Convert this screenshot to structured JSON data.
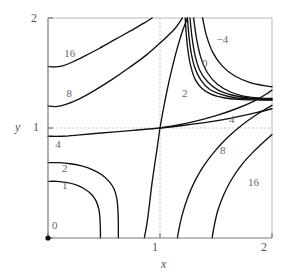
{
  "chart_data": {
    "type": "line",
    "title": "",
    "xlabel": "x",
    "ylabel": "y",
    "xlim": [
      0,
      2
    ],
    "ylim": [
      0,
      2
    ],
    "grid": true,
    "grid_lines": {
      "x": [
        1
      ],
      "y": [
        1
      ],
      "style": "dashed"
    },
    "xticks": [
      0,
      1,
      2
    ],
    "xtick_labels": [
      "0",
      "1",
      "2"
    ],
    "yticks": [
      0,
      1,
      2
    ],
    "ytick_labels": [
      "0",
      "1",
      "2"
    ],
    "origin_marker": true,
    "saddle_point": [
      1,
      1
    ],
    "contour_levels": [
      -4,
      0,
      1,
      2,
      4,
      8,
      16
    ],
    "contour_labels": [
      {
        "text": "16",
        "x": 0.19,
        "y": 1.67
      },
      {
        "text": "8",
        "x": 0.21,
        "y": 1.31
      },
      {
        "text": "4",
        "x": 0.11,
        "y": 0.85
      },
      {
        "text": "2",
        "x": 0.17,
        "y": 0.63
      },
      {
        "text": "1",
        "x": 0.17,
        "y": 0.47
      },
      {
        "text": "0",
        "x": 0.08,
        "y": 0.11
      },
      {
        "text": "−4",
        "x": 1.55,
        "y": 1.8
      },
      {
        "text": "0",
        "x": 1.42,
        "y": 1.58
      },
      {
        "text": "2",
        "x": 1.24,
        "y": 1.31
      },
      {
        "text": "4",
        "x": 1.66,
        "y": 1.07
      },
      {
        "text": "8",
        "x": 1.58,
        "y": 0.79
      },
      {
        "text": "16",
        "x": 1.83,
        "y": 0.5
      }
    ],
    "series": [
      {
        "name": "level-16-lower-left",
        "level": 16,
        "points": [
          [
            0.0,
            1.56
          ],
          [
            0.06,
            1.555
          ],
          [
            0.13,
            1.565
          ],
          [
            0.22,
            1.6
          ],
          [
            0.33,
            1.655
          ],
          [
            0.46,
            1.725
          ],
          [
            0.6,
            1.805
          ],
          [
            0.74,
            1.885
          ],
          [
            0.86,
            1.955
          ],
          [
            0.93,
            2.0
          ]
        ]
      },
      {
        "name": "level-8-lower-left",
        "level": 8,
        "points": [
          [
            0.0,
            1.2
          ],
          [
            0.07,
            1.195
          ],
          [
            0.16,
            1.215
          ],
          [
            0.28,
            1.265
          ],
          [
            0.42,
            1.345
          ],
          [
            0.57,
            1.44
          ],
          [
            0.72,
            1.545
          ],
          [
            0.88,
            1.665
          ],
          [
            1.02,
            1.79
          ],
          [
            1.13,
            1.9
          ],
          [
            1.2,
            2.0
          ]
        ]
      },
      {
        "name": "level-4-crossing",
        "level": 4,
        "points": [
          [
            0.0,
            0.925
          ],
          [
            0.12,
            0.925
          ],
          [
            0.26,
            0.935
          ],
          [
            0.42,
            0.95
          ],
          [
            0.6,
            0.965
          ],
          [
            0.8,
            0.982
          ],
          [
            1.0,
            1.0
          ],
          [
            1.22,
            1.025
          ],
          [
            1.44,
            1.055
          ],
          [
            1.66,
            1.095
          ],
          [
            1.86,
            1.14
          ],
          [
            2.0,
            1.175
          ]
        ]
      },
      {
        "name": "level-4-vertical-branch",
        "level": 4,
        "points": [
          [
            0.86,
            0.0
          ],
          [
            0.885,
            0.14
          ],
          [
            0.905,
            0.3
          ],
          [
            0.925,
            0.47
          ],
          [
            0.95,
            0.65
          ],
          [
            0.975,
            0.82
          ],
          [
            1.0,
            1.0
          ],
          [
            1.03,
            1.17
          ],
          [
            1.065,
            1.35
          ],
          [
            1.105,
            1.53
          ],
          [
            1.15,
            1.71
          ],
          [
            1.2,
            1.88
          ],
          [
            1.245,
            2.0
          ]
        ]
      },
      {
        "name": "level-2-lower-left",
        "level": 2,
        "points": [
          [
            0.0,
            0.685
          ],
          [
            0.1,
            0.685
          ],
          [
            0.2,
            0.675
          ],
          [
            0.3,
            0.655
          ],
          [
            0.4,
            0.62
          ],
          [
            0.48,
            0.575
          ],
          [
            0.545,
            0.515
          ],
          [
            0.59,
            0.445
          ],
          [
            0.615,
            0.355
          ],
          [
            0.625,
            0.245
          ],
          [
            0.628,
            0.12
          ],
          [
            0.628,
            0.0
          ]
        ]
      },
      {
        "name": "level-1-lower-left",
        "level": 1,
        "points": [
          [
            0.0,
            0.515
          ],
          [
            0.08,
            0.515
          ],
          [
            0.16,
            0.505
          ],
          [
            0.245,
            0.485
          ],
          [
            0.32,
            0.45
          ],
          [
            0.385,
            0.4
          ],
          [
            0.43,
            0.335
          ],
          [
            0.455,
            0.255
          ],
          [
            0.465,
            0.155
          ],
          [
            0.468,
            0.06
          ],
          [
            0.468,
            0.0
          ]
        ]
      },
      {
        "name": "level-2-upper-right-bundle-a",
        "level": 2,
        "points": [
          [
            1.225,
            2.0
          ],
          [
            1.235,
            1.85
          ],
          [
            1.25,
            1.7
          ],
          [
            1.275,
            1.56
          ],
          [
            1.315,
            1.44
          ],
          [
            1.375,
            1.36
          ],
          [
            1.46,
            1.305
          ],
          [
            1.57,
            1.275
          ],
          [
            1.7,
            1.26
          ],
          [
            1.85,
            1.255
          ],
          [
            2.0,
            1.255
          ]
        ]
      },
      {
        "name": "level-2-upper-right-bundle-b",
        "level": 2,
        "points": [
          [
            1.245,
            2.0
          ],
          [
            1.258,
            1.84
          ],
          [
            1.278,
            1.685
          ],
          [
            1.312,
            1.545
          ],
          [
            1.365,
            1.435
          ],
          [
            1.44,
            1.355
          ],
          [
            1.545,
            1.305
          ],
          [
            1.67,
            1.275
          ],
          [
            1.82,
            1.262
          ],
          [
            2.0,
            1.258
          ]
        ]
      },
      {
        "name": "level-2-upper-right-bundle-c",
        "level": 2,
        "points": [
          [
            1.268,
            2.0
          ],
          [
            1.285,
            1.83
          ],
          [
            1.312,
            1.665
          ],
          [
            1.355,
            1.525
          ],
          [
            1.425,
            1.42
          ],
          [
            1.52,
            1.345
          ],
          [
            1.64,
            1.3
          ],
          [
            1.78,
            1.275
          ],
          [
            1.92,
            1.265
          ],
          [
            2.0,
            1.263
          ]
        ]
      },
      {
        "name": "level-0-upper-right",
        "level": 0,
        "points": [
          [
            1.3,
            2.0
          ],
          [
            1.325,
            1.82
          ],
          [
            1.365,
            1.64
          ],
          [
            1.425,
            1.5
          ],
          [
            1.515,
            1.395
          ],
          [
            1.635,
            1.325
          ],
          [
            1.775,
            1.285
          ],
          [
            1.9,
            1.272
          ],
          [
            2.0,
            1.268
          ]
        ]
      },
      {
        "name": "level-neg4-upper-right",
        "level": -4,
        "points": [
          [
            1.38,
            2.0
          ],
          [
            1.415,
            1.84
          ],
          [
            1.47,
            1.69
          ],
          [
            1.555,
            1.565
          ],
          [
            1.665,
            1.475
          ],
          [
            1.8,
            1.415
          ],
          [
            1.93,
            1.385
          ],
          [
            2.0,
            1.375
          ]
        ]
      },
      {
        "name": "level-4-right-diagonal",
        "level": 4,
        "points": [
          [
            1.0,
            1.0
          ],
          [
            1.15,
            1.025
          ],
          [
            1.32,
            1.062
          ],
          [
            1.5,
            1.112
          ],
          [
            1.68,
            1.175
          ],
          [
            1.84,
            1.245
          ],
          [
            1.96,
            1.315
          ],
          [
            2.0,
            1.345
          ]
        ]
      },
      {
        "name": "level-8-lower-right",
        "level": 8,
        "points": [
          [
            1.155,
            0.0
          ],
          [
            1.175,
            0.11
          ],
          [
            1.205,
            0.235
          ],
          [
            1.25,
            0.375
          ],
          [
            1.31,
            0.515
          ],
          [
            1.39,
            0.655
          ],
          [
            1.49,
            0.79
          ],
          [
            1.605,
            0.915
          ],
          [
            1.735,
            1.03
          ],
          [
            1.875,
            1.13
          ],
          [
            2.0,
            1.205
          ]
        ]
      },
      {
        "name": "level-16-lower-right",
        "level": 16,
        "points": [
          [
            1.465,
            0.0
          ],
          [
            1.485,
            0.115
          ],
          [
            1.515,
            0.245
          ],
          [
            1.565,
            0.385
          ],
          [
            1.635,
            0.525
          ],
          [
            1.725,
            0.66
          ],
          [
            1.835,
            0.785
          ],
          [
            1.95,
            0.895
          ],
          [
            2.0,
            0.94
          ]
        ]
      }
    ]
  },
  "axes": {
    "x_label": "x",
    "y_label": "y",
    "x_ticks": [
      "0",
      "1",
      "2"
    ],
    "y_ticks": [
      "0",
      "1",
      "2"
    ]
  },
  "colors": {
    "contour": "#111111",
    "frame": "#b8b8b8",
    "axis": "#7a7a7a",
    "grid": "#c9c9c9",
    "text": "#555555",
    "background": "#ffffff"
  }
}
